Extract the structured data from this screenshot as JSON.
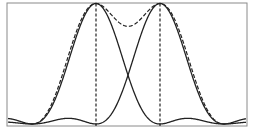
{
  "chart_data": {
    "type": "line",
    "title": "",
    "xlabel": "",
    "ylabel": "",
    "grid": false,
    "legend": null,
    "xlim": [
      -2,
      3
    ],
    "ylim": [
      0,
      1
    ],
    "peaks": [
      {
        "name": "peak-1",
        "center": 0,
        "height": 1.0
      },
      {
        "name": "peak-2",
        "center": 1,
        "height": 1.0
      }
    ],
    "series": [
      {
        "name": "Source 1 intensity",
        "style": "solid",
        "function": "sinc^2 centered at 0"
      },
      {
        "name": "Source 2 intensity",
        "style": "solid",
        "function": "sinc^2 centered at 1"
      },
      {
        "name": "Combined intensity (envelope)",
        "style": "dashed",
        "dip_value": 0.81
      },
      {
        "name": "Peak 1 marker",
        "style": "dashed-vertical",
        "x": 0
      },
      {
        "name": "Peak 2 marker",
        "style": "dashed-vertical",
        "x": 1
      }
    ],
    "crossing_point": {
      "x": 0.5,
      "y": 0.4
    }
  },
  "colors": {
    "line": "#222222",
    "frame": "#8a8a8a",
    "background": "#ffffff"
  },
  "layout": {
    "frame": {
      "left": 7,
      "top": 3,
      "right": 247,
      "bottom": 126
    },
    "peak1_px": 96,
    "peak2_px": 160
  }
}
